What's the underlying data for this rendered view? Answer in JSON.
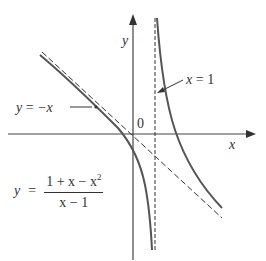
{
  "diagram": {
    "type": "function graph with asymptotes",
    "axes": {
      "x_label": "x",
      "y_label": "y",
      "origin_label": "0"
    },
    "asymptotes": {
      "vertical": {
        "label_var": "x",
        "label_eq": "=",
        "label_val": "1"
      },
      "slant": {
        "label_var": "y",
        "label_eq": "=",
        "label_val": "−x"
      }
    },
    "function": {
      "lhs": "y",
      "eq": "=",
      "numerator": "1 + x − x",
      "numerator_exp": "2",
      "denominator": "x − 1"
    },
    "colors": {
      "curve": "#555555",
      "axes": "#444444",
      "asymptote": "#333333",
      "text": "#333333"
    }
  }
}
